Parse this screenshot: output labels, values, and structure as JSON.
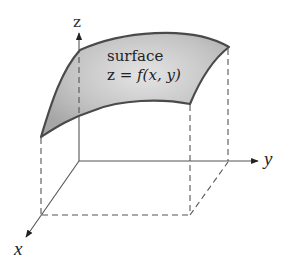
{
  "diagram": {
    "axes": {
      "x_label": "x",
      "y_label": "y",
      "z_label": "z"
    },
    "surface": {
      "label_line1": "surface",
      "label_line2_prefix": "z = ",
      "label_line2_func": "f",
      "label_line2_args": "(x, y)"
    },
    "colors": {
      "surface_fill_light": "#e2e2e2",
      "surface_fill_dark": "#a9a9a9",
      "surface_edge": "#4a4a4a",
      "axis": "#555555",
      "dashed": "#555555",
      "text": "#222222"
    }
  }
}
